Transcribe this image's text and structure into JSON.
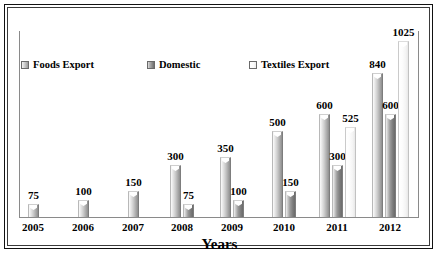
{
  "chart_data": {
    "type": "bar",
    "title": "",
    "xlabel": "Years",
    "ylabel": "",
    "categories": [
      "2005",
      "2006",
      "2007",
      "2008",
      "2009",
      "2010",
      "2011",
      "2012"
    ],
    "series": [
      {
        "name": "Foods Export",
        "values": [
          75,
          100,
          150,
          300,
          350,
          500,
          600,
          840
        ]
      },
      {
        "name": "Domestic",
        "values": [
          null,
          null,
          null,
          75,
          100,
          150,
          300,
          600
        ]
      },
      {
        "name": "Textiles Export",
        "values": [
          null,
          null,
          null,
          null,
          null,
          null,
          525,
          1025
        ]
      }
    ],
    "ylim": [
      0,
      1100
    ],
    "grid": false,
    "legend_position": "top-left",
    "data_labels": true
  },
  "legend": {
    "items": [
      {
        "label": "Foods Export",
        "swatch": "bar-swatch-foods"
      },
      {
        "label": "Domestic",
        "swatch": "bar-swatch-domestic"
      },
      {
        "label": "Textiles Export",
        "swatch": "bar-swatch-textiles"
      }
    ]
  },
  "axis": {
    "x_title": "Years",
    "x_ticks": [
      "2005",
      "2006",
      "2007",
      "2008",
      "2009",
      "2010",
      "2011",
      "2012"
    ]
  },
  "colors": {
    "series_foods": "#a8a8a8",
    "series_domestic": "#7a7a7a",
    "series_textiles": "#f4f4f4",
    "axis": "#8a8a8a",
    "frame": "#111111",
    "background": "#ffffff",
    "text": "#000000"
  }
}
